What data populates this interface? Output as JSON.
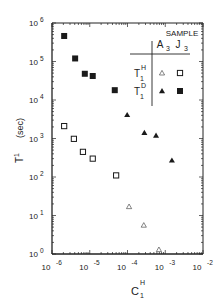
{
  "chart_data": {
    "type": "scatter",
    "title": "",
    "xlabel": "C",
    "xlabel_sub": "1",
    "xlabel_sup": "H",
    "ylabel": "T",
    "ylabel_sub": "1",
    "ylabel_unit": "(sec)",
    "xscale": "log",
    "yscale": "log",
    "xlim": [
      1e-06,
      0.01
    ],
    "ylim": [
      1,
      1000000.0
    ],
    "grid": false,
    "x_ticks": [
      {
        "base": "10",
        "exp": "-6",
        "value": 1e-06
      },
      {
        "base": "10",
        "exp": "-5",
        "value": 1e-05
      },
      {
        "base": "10",
        "exp": "-4",
        "value": 0.0001
      },
      {
        "base": "10",
        "exp": "-3",
        "value": 0.001
      },
      {
        "base": "10",
        "exp": "-2",
        "value": 0.01
      }
    ],
    "y_ticks": [
      {
        "base": "10",
        "exp": "0",
        "value": 1
      },
      {
        "base": "10",
        "exp": "1",
        "value": 10
      },
      {
        "base": "10",
        "exp": "2",
        "value": 100
      },
      {
        "base": "10",
        "exp": "3",
        "value": 1000
      },
      {
        "base": "10",
        "exp": "4",
        "value": 10000
      },
      {
        "base": "10",
        "exp": "5",
        "value": 100000
      },
      {
        "base": "10",
        "exp": "6",
        "value": 1000000
      }
    ],
    "legend": {
      "placement": "top-right",
      "header": "SAMPLE",
      "columns": [
        {
          "label": "A",
          "sub": "3"
        },
        {
          "label": "J",
          "sub": "3"
        }
      ],
      "rows": [
        {
          "label": "T",
          "sub": "1",
          "sup": "H"
        },
        {
          "label": "T",
          "sub": "1",
          "sup": "D"
        }
      ]
    },
    "series": [
      {
        "name": "J3 T1H",
        "marker": "open-square",
        "points": [
          {
            "x": 2.1e-06,
            "y": 2100
          },
          {
            "x": 3.8e-06,
            "y": 980
          },
          {
            "x": 6.6e-06,
            "y": 450
          },
          {
            "x": 1.2e-05,
            "y": 300
          },
          {
            "x": 5e-05,
            "y": 110
          }
        ]
      },
      {
        "name": "J3 T1D",
        "marker": "filled-square",
        "points": [
          {
            "x": 2.1e-06,
            "y": 460000
          },
          {
            "x": 4.1e-06,
            "y": 120000
          },
          {
            "x": 7.4e-06,
            "y": 48000
          },
          {
            "x": 1.2e-05,
            "y": 42000
          },
          {
            "x": 4.6e-05,
            "y": 18000
          }
        ]
      },
      {
        "name": "A3 T1H",
        "marker": "open-triangle",
        "points": [
          {
            "x": 0.00011,
            "y": 17
          },
          {
            "x": 0.00027,
            "y": 5.6
          },
          {
            "x": 0.00068,
            "y": 1.3
          }
        ]
      },
      {
        "name": "A3 T1D",
        "marker": "filled-triangle",
        "points": [
          {
            "x": 9.8e-05,
            "y": 4100
          },
          {
            "x": 0.00028,
            "y": 1400
          },
          {
            "x": 0.00057,
            "y": 1200
          },
          {
            "x": 0.0015,
            "y": 270
          }
        ]
      }
    ]
  }
}
